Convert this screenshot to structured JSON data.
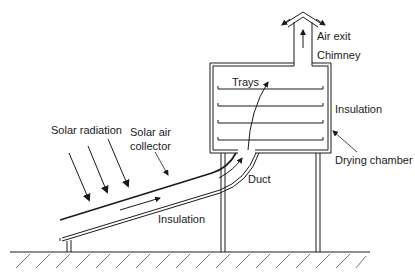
{
  "diagram": {
    "labels": {
      "air_exit": "Air exit",
      "chimney": "Chimney",
      "trays": "Trays",
      "insulation_chamber": "Insulation",
      "drying_chamber": "Drying chamber",
      "solar_radiation": "Solar radiation",
      "collector_line1": "Solar air",
      "collector_line2": "collector",
      "duct": "Duct",
      "insulation_collector": "Insulation"
    },
    "components": [
      "chimney",
      "drying chamber",
      "trays",
      "duct",
      "solar air collector",
      "supports",
      "ground"
    ],
    "tray_count": 4,
    "radiation_arrow_count": 3,
    "colors": {
      "line": "#1a1a1a",
      "insulation_fill": "#bdbdbd",
      "background": "#ffffff"
    }
  }
}
